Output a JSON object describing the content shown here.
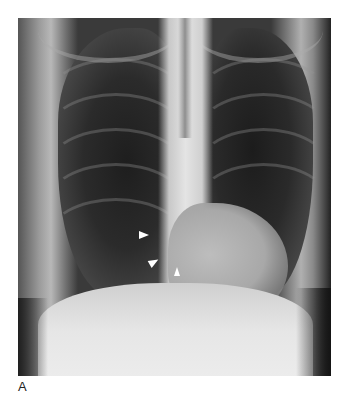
{
  "figure": {
    "panel_label": "A",
    "image_description": "Frontal chest radiograph",
    "annotations": [
      {
        "type": "arrowhead",
        "direction": "right",
        "color": "#ffffff"
      },
      {
        "type": "arrowhead",
        "direction": "up-right",
        "color": "#ffffff"
      },
      {
        "type": "arrowhead",
        "direction": "up",
        "color": "#ffffff"
      }
    ]
  }
}
